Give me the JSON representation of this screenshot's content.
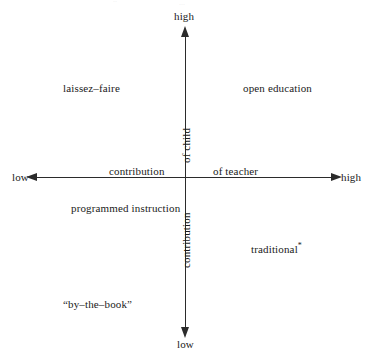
{
  "figure": {
    "type": "quadrant-diagram",
    "background_color": "#ffffff",
    "ink_color": "#1a1a1a",
    "axis_color": "#2b2b2b"
  },
  "axes": {
    "vertical": {
      "name": "contribution of child",
      "word_upper": "of child",
      "word_lower": "contribution",
      "top_end_label": "high",
      "bottom_end_label": "low",
      "arrow_top": "arrow-up-icon",
      "arrow_bottom": "arrow-down-icon"
    },
    "horizontal": {
      "name": "contribution of teacher",
      "word_left": "contribution",
      "word_right": "of teacher",
      "left_end_label": "low",
      "right_end_label": "high",
      "arrow_left": "arrow-left-icon",
      "arrow_right": "arrow-right-icon"
    }
  },
  "quadrant_labels": [
    {
      "text": "laissez–faire",
      "quadrant": "top-left"
    },
    {
      "text": "open education",
      "quadrant": "top-right"
    },
    {
      "text": "programmed instruction",
      "quadrant": "bottom-left"
    },
    {
      "text": "traditional",
      "quadrant": "bottom-right",
      "footnote_marker": "*"
    },
    {
      "text": "“by–the–book”",
      "quadrant": "bottom-left-lower"
    }
  ],
  "artifacts": {
    "top_left_mark": "··",
    "top_center_mark": "···"
  },
  "chart_data": {
    "type": "scatter",
    "title": "",
    "subtitle": "",
    "xlabel": "contribution of teacher",
    "ylabel": "contribution of child",
    "xlim": [
      "low",
      "high"
    ],
    "ylim": [
      "low",
      "high"
    ],
    "xticklabels": [
      "low",
      "high"
    ],
    "yticklabels": [
      "low",
      "high"
    ],
    "grid": false,
    "legend": "none",
    "annotations": [
      {
        "label": "laissez–faire",
        "x": "low",
        "y": "high",
        "x_frac": 0.27,
        "y_frac": 0.76
      },
      {
        "label": "open education",
        "x": "high",
        "y": "high",
        "x_frac": 0.76,
        "y_frac": 0.76
      },
      {
        "label": "programmed instruction",
        "x": "low",
        "y": "low",
        "x_frac": 0.32,
        "y_frac": 0.42
      },
      {
        "label": "traditional*",
        "x": "high",
        "y": "low",
        "x_frac": 0.77,
        "y_frac": 0.3
      },
      {
        "label": "“by–the–book”",
        "x": "low",
        "y": "low",
        "x_frac": 0.26,
        "y_frac": 0.14
      }
    ],
    "axis_origin_frac": {
      "x": 0.5,
      "y": 0.51
    }
  }
}
